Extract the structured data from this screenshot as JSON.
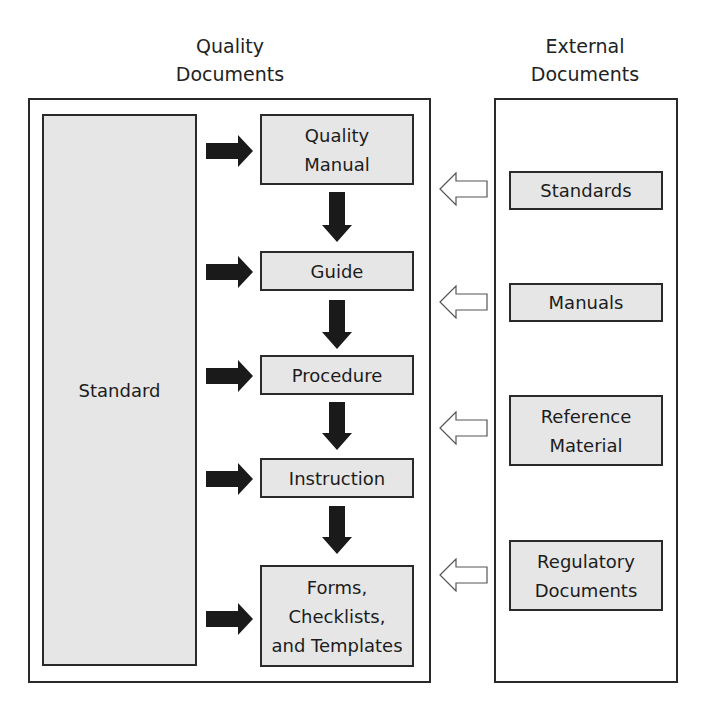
{
  "headings": {
    "quality": "Quality\nDocuments",
    "external": "External\nDocuments"
  },
  "standard_box": {
    "label": "Standard"
  },
  "quality_documents": [
    {
      "label": "Quality\nManual"
    },
    {
      "label": "Guide"
    },
    {
      "label": "Procedure"
    },
    {
      "label": "Instruction"
    },
    {
      "label": "Forms,\nChecklists,\nand Templates"
    }
  ],
  "external_documents": [
    {
      "label": "Standards"
    },
    {
      "label": "Manuals"
    },
    {
      "label": "Reference\nMaterial"
    },
    {
      "label": "Regulatory\nDocuments"
    }
  ],
  "colors": {
    "box_fill": "#e6e6e6",
    "border": "#2a2a2a",
    "solid_arrow": "#1a1a1a",
    "hollow_arrow_stroke": "#555555"
  }
}
